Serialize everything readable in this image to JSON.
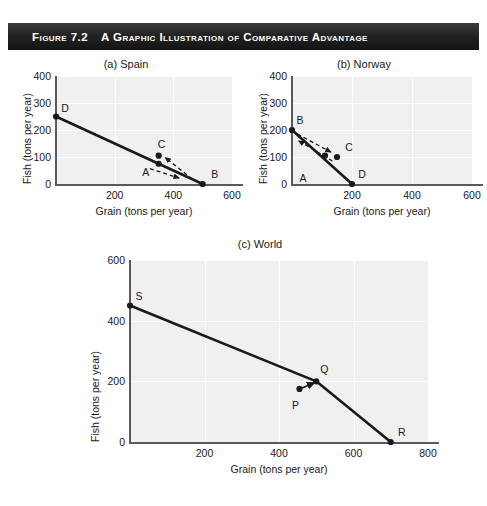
{
  "figure": {
    "number": "Figure 7.2",
    "title": "A Graphic Illustration of Comparative Advantage",
    "banner_color": "#1c1c1c",
    "banner_text_color": "#ffffff"
  },
  "caption": "",
  "chart_data": [
    {
      "type": "line",
      "panel": "a",
      "title": "(a) Spain",
      "xlabel": "Grain (tons per year)",
      "ylabel": "Fish (tons per year)",
      "xlim": [
        0,
        600
      ],
      "ylim": [
        0,
        400
      ],
      "xticks": [
        200,
        400,
        600
      ],
      "yticks": [
        0,
        100,
        200,
        300,
        400
      ],
      "grid": true,
      "series": [
        {
          "name": "Production possibilities frontier",
          "style": "solid-thick",
          "x": [
            0,
            500
          ],
          "y": [
            250,
            0
          ]
        }
      ],
      "points": [
        {
          "label": "D",
          "x": 0,
          "y": 250,
          "label_dx": 9,
          "label_dy": -9
        },
        {
          "label": "B",
          "x": 500,
          "y": 0,
          "label_dx": 12,
          "label_dy": -10
        },
        {
          "label": "C",
          "x": 350,
          "y": 105,
          "label_dx": 3,
          "label_dy": -12
        },
        {
          "label": "A",
          "x": 350,
          "y": 75,
          "label_dx": -13,
          "label_dy": 8
        }
      ],
      "arrows": [
        {
          "name": "trade-arrow-up",
          "x1": 465,
          "y1": 18,
          "x2": 372,
          "y2": 98,
          "style": "dashed"
        },
        {
          "name": "trade-arrow-down",
          "x1": 320,
          "y1": 57,
          "x2": 420,
          "y2": 22,
          "style": "dashed"
        }
      ]
    },
    {
      "type": "line",
      "panel": "b",
      "title": "(b) Norway",
      "xlabel": "Grain (tons per year)",
      "ylabel": "Fish (tons per year)",
      "xlim": [
        0,
        600
      ],
      "ylim": [
        0,
        400
      ],
      "xticks": [
        200,
        400,
        600
      ],
      "yticks": [
        0,
        100,
        200,
        300,
        400
      ],
      "grid": true,
      "series": [
        {
          "name": "Production possibilities frontier",
          "style": "solid-thick",
          "x": [
            0,
            200
          ],
          "y": [
            200,
            0
          ]
        }
      ],
      "points": [
        {
          "label": "B",
          "x": 0,
          "y": 200,
          "label_dx": 8,
          "label_dy": -10
        },
        {
          "label": "D",
          "x": 200,
          "y": 0,
          "label_dx": 10,
          "label_dy": -10
        },
        {
          "label": "C",
          "x": 150,
          "y": 100,
          "label_dx": 12,
          "label_dy": -10
        },
        {
          "label": "A",
          "x": 110,
          "y": 105,
          "label_dx": -22,
          "label_dy": 22
        }
      ],
      "arrows": [
        {
          "name": "trade-arrow-up",
          "x1": 135,
          "y1": 85,
          "x2": 22,
          "y2": 160,
          "style": "dashed"
        },
        {
          "name": "trade-arrow-down",
          "x1": 18,
          "y1": 185,
          "x2": 130,
          "y2": 118,
          "style": "dashed"
        }
      ]
    },
    {
      "type": "line",
      "panel": "c",
      "title": "(c) World",
      "xlabel": "Grain (tons per year)",
      "ylabel": "Fish (tons per year)",
      "xlim": [
        0,
        800
      ],
      "ylim": [
        0,
        600
      ],
      "xticks": [
        200,
        400,
        600,
        800
      ],
      "yticks": [
        0,
        200,
        400,
        600
      ],
      "grid": true,
      "series": [
        {
          "name": "World production possibilities frontier",
          "style": "solid-thick",
          "x": [
            0,
            500,
            700
          ],
          "y": [
            450,
            200,
            0
          ]
        }
      ],
      "points": [
        {
          "label": "S",
          "x": 0,
          "y": 450,
          "label_dx": 9,
          "label_dy": -10
        },
        {
          "label": "Q",
          "x": 500,
          "y": 200,
          "label_dx": 8,
          "label_dy": -12
        },
        {
          "label": "R",
          "x": 700,
          "y": 0,
          "label_dx": 11,
          "label_dy": -10
        },
        {
          "label": "P",
          "x": 455,
          "y": 175,
          "label_dx": -4,
          "label_dy": 16
        }
      ],
      "arrows": [
        {
          "name": "gains-from-trade-arrow",
          "x1": 462,
          "y1": 178,
          "x2": 496,
          "y2": 196,
          "style": "solid"
        }
      ]
    }
  ]
}
